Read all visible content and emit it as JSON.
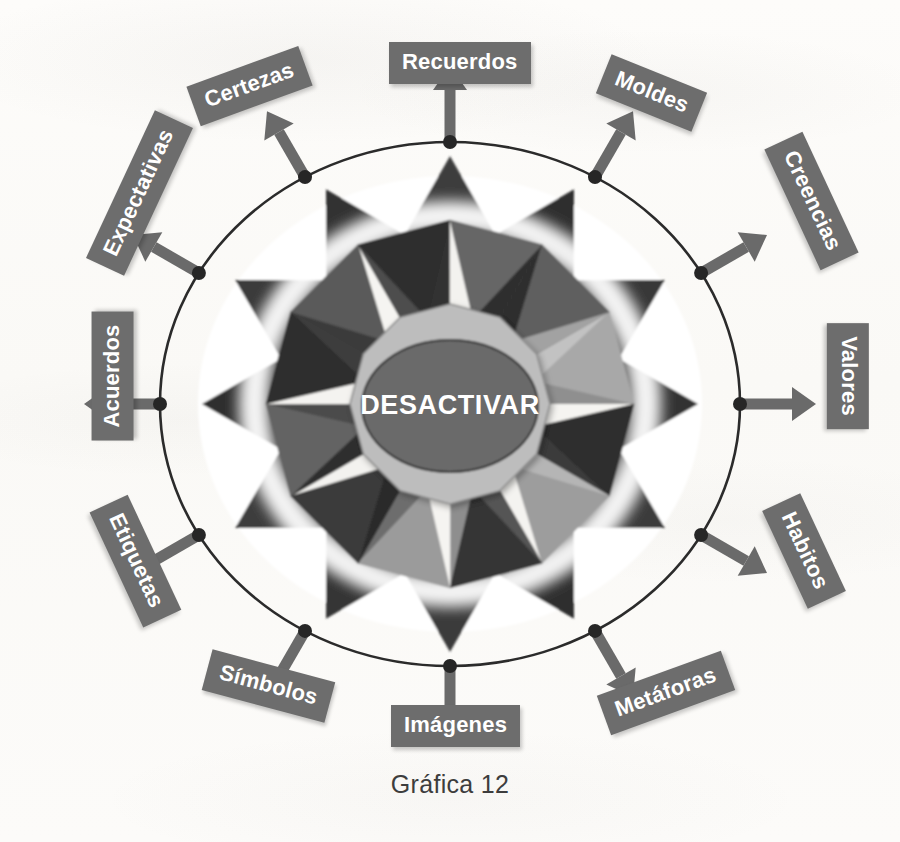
{
  "figure": {
    "caption": "Gráfica 12",
    "center_label": "DESACTIVAR"
  },
  "colors": {
    "chip_background": "#6d6d6d",
    "chip_text": "#ffffff",
    "center_fill": "#6b6b6b",
    "center_ring": "#b9b9b9",
    "star_dark": "#3a3a3a",
    "star_mid": "#6f6f6f",
    "star_light": "#a9a9a9",
    "star_white": "#f7f6f3",
    "ring_outline": "#2b2b2b",
    "node_dot": "#262626",
    "arrow": "#6a6a6a",
    "paper": "#fbfaf8",
    "caption_text": "#3d3d3d"
  },
  "nodes": [
    {
      "id": "recuerdos",
      "label": "Recuerdos",
      "angle_deg": 270,
      "rotation_deg": 0,
      "chip_x": 389,
      "chip_y": 42,
      "icon": "arrow-up-icon"
    },
    {
      "id": "moldes",
      "label": "Moldes",
      "angle_deg": 300,
      "rotation_deg": 22,
      "chip_x": 600,
      "chip_y": 72,
      "icon": "arrow-up-right-icon"
    },
    {
      "id": "creencias",
      "label": "Creencias",
      "angle_deg": 330,
      "rotation_deg": 65,
      "chip_x": 745,
      "chip_y": 180,
      "icon": "arrow-up-right-icon"
    },
    {
      "id": "valores",
      "label": "Valores",
      "angle_deg": 0,
      "rotation_deg": 90,
      "chip_x": 795,
      "chip_y": 355,
      "icon": "arrow-right-icon"
    },
    {
      "id": "habitos",
      "label": "Habitos",
      "angle_deg": 30,
      "rotation_deg": 65,
      "chip_x": 750,
      "chip_y": 530,
      "icon": "arrow-down-right-icon"
    },
    {
      "id": "metaforas",
      "label": "Metáforas",
      "angle_deg": 60,
      "rotation_deg": -20,
      "chip_x": 600,
      "chip_y": 672,
      "icon": "arrow-down-right-icon"
    },
    {
      "id": "imagenes",
      "label": "Imágenes",
      "angle_deg": 90,
      "rotation_deg": 0,
      "chip_x": 391,
      "chip_y": 705,
      "icon": "arrow-down-icon"
    },
    {
      "id": "simbolos",
      "label": "Símbolos",
      "angle_deg": 120,
      "rotation_deg": 15,
      "chip_x": 205,
      "chip_y": 665,
      "icon": "arrow-down-left-icon"
    },
    {
      "id": "etiquetas",
      "label": "Etiquetas",
      "angle_deg": 150,
      "rotation_deg": 65,
      "chip_x": 72,
      "chip_y": 540,
      "icon": "arrow-down-left-icon"
    },
    {
      "id": "acuerdos",
      "label": "Acuerdos",
      "angle_deg": 180,
      "rotation_deg": -90,
      "chip_x": 48,
      "chip_y": 355,
      "icon": "arrow-left-icon"
    },
    {
      "id": "expectativas",
      "label": "Expectativas",
      "angle_deg": 210,
      "rotation_deg": -65,
      "chip_x": 58,
      "chip_y": 172,
      "icon": "arrow-up-left-icon"
    },
    {
      "id": "certezas",
      "label": "Certezas",
      "angle_deg": 240,
      "rotation_deg": -20,
      "chip_x": 190,
      "chip_y": 65,
      "icon": "arrow-up-left-icon"
    }
  ],
  "chart_data": {
    "type": "diagram",
    "title": "Gráfica 12",
    "center": "DESACTIVAR",
    "layout": "radial-hub-and-spoke",
    "spoke_count": 12,
    "spokes": [
      "Recuerdos",
      "Moldes",
      "Creencias",
      "Valores",
      "Habitos",
      "Metáforas",
      "Imágenes",
      "Símbolos",
      "Etiquetas",
      "Acuerdos",
      "Expectativas",
      "Certezas"
    ],
    "ring": {
      "shape": "ellipse",
      "rx": 290,
      "ry": 262,
      "node_markers": 12
    },
    "star": {
      "points": 12,
      "facet_shades": [
        "dark",
        "mid",
        "light",
        "white"
      ]
    }
  }
}
